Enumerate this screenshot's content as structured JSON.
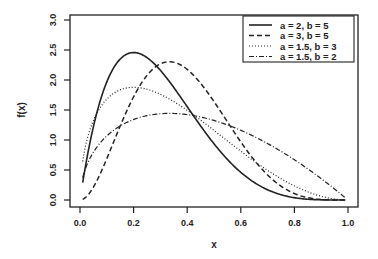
{
  "chart_data": {
    "type": "line",
    "title": "",
    "xlabel": "x",
    "ylabel": "f(x)",
    "xlim": [
      0.0,
      1.0
    ],
    "ylim": [
      0.0,
      3.0
    ],
    "x_ticks": [
      "0.0",
      "0.2",
      "0.4",
      "0.6",
      "0.8",
      "1.0"
    ],
    "y_ticks": [
      "0.0",
      "0.5",
      "1.0",
      "1.5",
      "2.0",
      "2.5",
      "3.0"
    ],
    "grid": false,
    "legend_position": "top-right",
    "series": [
      {
        "name": "a = 2, b = 5",
        "a": 2,
        "b": 5,
        "line_style": "solid",
        "peak_x": 0.2,
        "peak_y": 2.46
      },
      {
        "name": "a = 3, b = 5",
        "a": 3,
        "b": 5,
        "line_style": "dashed",
        "peak_x": 0.33,
        "peak_y": 2.3
      },
      {
        "name": "a = 1.5, b = 3",
        "a": 1.5,
        "b": 3,
        "line_style": "dotted",
        "peak_x": 0.2,
        "peak_y": 1.86
      },
      {
        "name": "a = 1.5, b = 2",
        "a": 1.5,
        "b": 2,
        "line_style": "dotdash",
        "peak_x": 0.33,
        "peak_y": 1.44
      }
    ],
    "x": [
      0.01,
      0.05,
      0.1,
      0.15,
      0.2,
      0.25,
      0.3,
      0.35,
      0.4,
      0.45,
      0.5,
      0.55,
      0.6,
      0.65,
      0.7,
      0.75,
      0.8,
      0.85,
      0.9,
      0.95,
      0.99
    ]
  }
}
